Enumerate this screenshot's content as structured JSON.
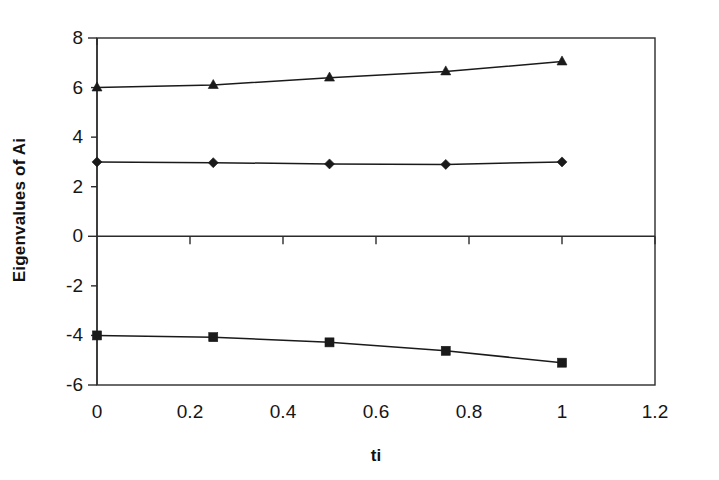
{
  "chart_data": {
    "type": "line",
    "title": "",
    "xlabel": "ti",
    "ylabel": "Eigenvalues of Ai",
    "x": [
      0,
      0.25,
      0.5,
      0.75,
      1
    ],
    "xlim": [
      0,
      1.2
    ],
    "ylim": [
      -6,
      8
    ],
    "xticks": [
      "0",
      "0.2",
      "0.4",
      "0.6",
      "0.8",
      "1",
      "1.2"
    ],
    "xtick_values": [
      0,
      0.2,
      0.4,
      0.6,
      0.8,
      1,
      1.2
    ],
    "yticks": [
      "8",
      "6",
      "4",
      "2",
      "0",
      "-2",
      "-4",
      "-6"
    ],
    "ytick_values": [
      8,
      6,
      4,
      2,
      0,
      -2,
      -4,
      -6
    ],
    "grid": false,
    "legend": "none",
    "series": [
      {
        "name": "series-triangle",
        "marker": "triangle",
        "color": "#1a1a1a",
        "values": [
          6.0,
          6.1,
          6.4,
          6.65,
          7.05
        ]
      },
      {
        "name": "series-diamond",
        "marker": "diamond",
        "color": "#1a1a1a",
        "values": [
          3.0,
          2.97,
          2.92,
          2.9,
          3.0
        ]
      },
      {
        "name": "series-square",
        "marker": "square",
        "color": "#1a1a1a",
        "values": [
          -4.0,
          -4.07,
          -4.28,
          -4.62,
          -5.1
        ]
      }
    ]
  },
  "axes": {
    "frame_color": "#2b2b2b",
    "zero_line_value": 0,
    "plot_background": "#ffffff"
  }
}
